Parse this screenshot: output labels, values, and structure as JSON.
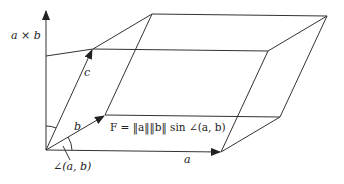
{
  "diagram": {
    "colors": {
      "stroke": "#333333",
      "text": "#222222",
      "background": "#ffffff"
    },
    "vertices": {
      "O": [
        46,
        150
      ],
      "A": [
        221,
        152
      ],
      "B": [
        105,
        115
      ],
      "C": [
        93,
        49
      ],
      "AB": [
        280,
        117
      ],
      "BC": [
        152,
        14
      ],
      "AC": [
        268,
        51
      ],
      "ABC": [
        327,
        16
      ],
      "axis_top": [
        46,
        10
      ],
      "axis_c_proj": [
        46,
        56
      ]
    },
    "labels": {
      "cross": "a × b",
      "c": "c",
      "b": "b",
      "a": "a",
      "formula": "F = ‖a‖‖b‖ sin ∠(a, b)",
      "angle": "∠(a, b)"
    }
  }
}
